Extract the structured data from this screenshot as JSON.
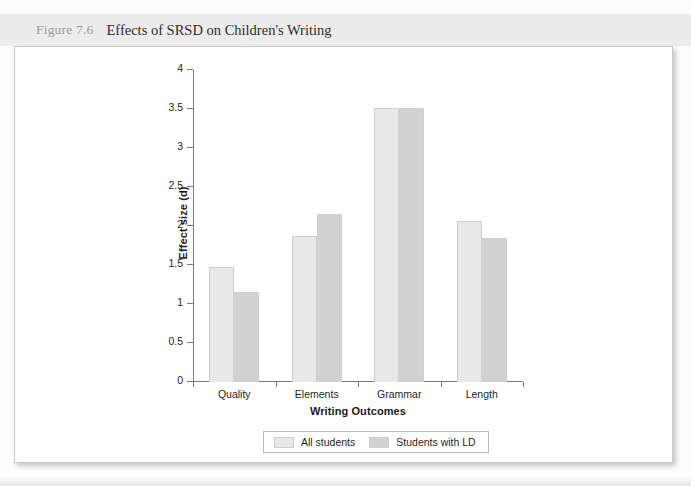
{
  "header": {
    "figure_number": "Figure 7.6",
    "title": "Effects of SRSD on Children's Writing"
  },
  "chart_data": {
    "type": "bar",
    "title": "Effects of SRSD on Children's Writing",
    "xlabel": "Writing Outcomes",
    "ylabel": "Effect size (d)",
    "categories": [
      "Quality",
      "Elements",
      "Grammar",
      "Length"
    ],
    "series": [
      {
        "name": "All students",
        "color": "#e8e8e8",
        "values": [
          1.48,
          1.87,
          3.51,
          2.06
        ]
      },
      {
        "name": "Students with LD",
        "color": "#d2d2d2",
        "values": [
          1.15,
          2.15,
          3.51,
          1.85
        ]
      }
    ],
    "ylim": [
      0,
      4
    ],
    "yticks": [
      "0",
      "0.5",
      "1",
      "1.5",
      "2",
      "2.5",
      "3",
      "3.5",
      "4"
    ],
    "ytick_values": [
      0,
      0.5,
      1,
      1.5,
      2,
      2.5,
      3,
      3.5,
      4
    ],
    "grid": false,
    "legend_position": "bottom"
  }
}
